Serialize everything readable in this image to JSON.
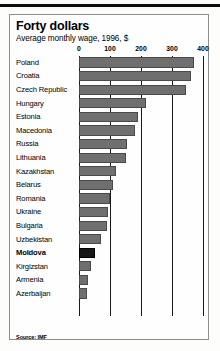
{
  "chart_data": {
    "type": "bar",
    "orientation": "horizontal",
    "title": "Forty dollars",
    "subtitle": "Average monthly wage, 1996, $",
    "xlabel": "",
    "ylabel": "",
    "xlim": [
      0,
      400
    ],
    "ticks": [
      0,
      100,
      200,
      300,
      400
    ],
    "tick_labels": [
      "0",
      "100",
      "200",
      "300",
      "400"
    ],
    "grid": true,
    "legend": null,
    "source": "Source: IMF",
    "highlight_category": "Moldova",
    "colors": {
      "bar": "#6f6f6f",
      "bar_highlight": "#171717",
      "grid": "#1a1a1a",
      "panel_border": "#8d8d8d",
      "background": "#fefefe",
      "text": "#000000"
    },
    "categories": [
      "Poland",
      "Croatia",
      "Czech Republic",
      "Hungary",
      "Estonia",
      "Macedonia",
      "Russia",
      "Lithuania",
      "Kazakhstan",
      "Belarus",
      "Romania",
      "Ukraine",
      "Bulgaria",
      "Uzbekistan",
      "Moldova",
      "Kirgizstan",
      "Armenia",
      "Azerbaijan"
    ],
    "values": [
      370,
      360,
      345,
      215,
      190,
      180,
      155,
      150,
      120,
      110,
      100,
      95,
      90,
      70,
      50,
      40,
      30,
      25
    ]
  }
}
